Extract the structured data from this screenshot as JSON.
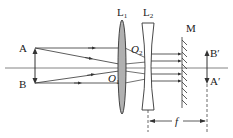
{
  "diagram": {
    "type": "optics-ray-diagram",
    "colors": {
      "line": "#333333",
      "lens_fill": "#b0b0b0",
      "axis": "#555555"
    },
    "labels": {
      "A": "A",
      "B": "B",
      "L1": "L",
      "L1_sub": "1",
      "L2": "L",
      "L2_sub": "2",
      "O1": "O",
      "O1_sub": "1",
      "O2": "O",
      "O2_sub": "2",
      "M": "M",
      "B_prime": "B′",
      "A_prime": "A′",
      "f": "f"
    },
    "elements": [
      {
        "id": "object-AB",
        "kind": "object arrow",
        "from": "A",
        "to": "B"
      },
      {
        "id": "lens-L1",
        "kind": "convex lens",
        "center": "O1"
      },
      {
        "id": "lens-L2",
        "kind": "concave lens",
        "center": "O2"
      },
      {
        "id": "mirror-M",
        "kind": "plane mirror"
      },
      {
        "id": "image-AB",
        "kind": "image arrow",
        "from": "B′",
        "to": "A′"
      },
      {
        "id": "focal-length",
        "kind": "dimension",
        "label": "f"
      }
    ]
  }
}
